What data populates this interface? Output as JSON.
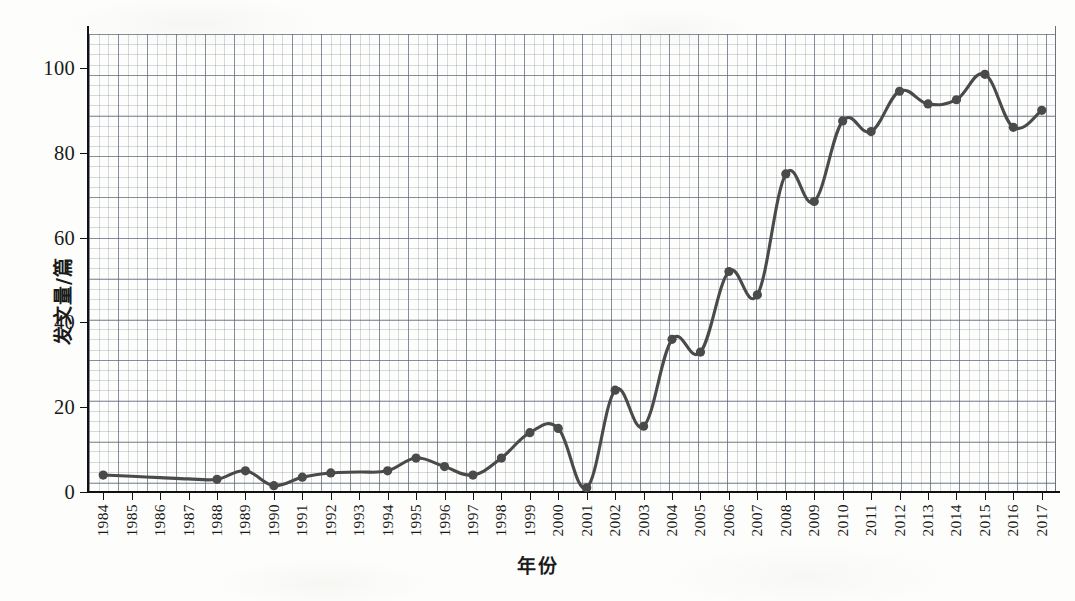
{
  "chart_data": {
    "type": "line",
    "title": "",
    "xlabel": "年份",
    "ylabel": "发文量/篇",
    "xlim": [
      1983.5,
      2017.5
    ],
    "ylim": [
      0,
      108
    ],
    "yticks": [
      0,
      20,
      40,
      60,
      80,
      100
    ],
    "ytick_labels": [
      "0",
      "20",
      "40",
      "60",
      "80",
      "100"
    ],
    "grid": true,
    "grid_style": "graph-paper",
    "legend": "none",
    "series_name": "发文量",
    "line_color": "#4a4a4a",
    "marker_color": "#4a4a4a",
    "marker_shape": "circle",
    "categories": [
      "1984",
      "1985",
      "1986",
      "1987",
      "1988",
      "1989",
      "1990",
      "1991",
      "1992",
      "1993",
      "1994",
      "1995",
      "1996",
      "1997",
      "1998",
      "1999",
      "2000",
      "2001",
      "2002",
      "2003",
      "2004",
      "2005",
      "2006",
      "2007",
      "2008",
      "2009",
      "2010",
      "2011",
      "2012",
      "2013",
      "2014",
      "2015",
      "2016",
      "2017"
    ],
    "values": [
      4,
      3.7,
      3.4,
      3.1,
      3,
      5,
      1.5,
      3.5,
      4.5,
      4.7,
      5,
      8,
      6,
      4,
      8,
      14,
      15,
      1,
      24,
      15.5,
      36,
      33,
      52,
      46.5,
      75,
      68.5,
      87.5,
      85,
      94.5,
      91.5,
      92.5,
      98.5,
      86,
      90
    ],
    "marker_visible": [
      true,
      false,
      false,
      false,
      true,
      true,
      true,
      true,
      true,
      false,
      true,
      true,
      true,
      true,
      true,
      true,
      true,
      true,
      true,
      true,
      true,
      true,
      true,
      true,
      true,
      true,
      true,
      true,
      true,
      true,
      true,
      true,
      true,
      true
    ]
  }
}
